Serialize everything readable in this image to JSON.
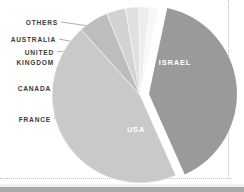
{
  "chart_data": {
    "type": "pie",
    "title": "",
    "subtitle": "",
    "xlabel": "",
    "ylabel": "",
    "legend_position": "callout-left",
    "grid": false,
    "exploded_slice": "ISRAEL",
    "categories": [
      "ISRAEL",
      "USA",
      "FRANCE",
      "CANADA",
      "UNITED KINGDOM",
      "AUSTRALIA",
      "OTHERS"
    ],
    "values": [
      40.0,
      45.0,
      5.5,
      3.5,
      2.5,
      2.0,
      1.5
    ],
    "slices": [
      {
        "label": "ISRAEL",
        "value": 40.0,
        "color": "#9a9a9a",
        "label_placement": "inside",
        "exploded": true
      },
      {
        "label": "USA",
        "value": 45.0,
        "color": "#c9c9c9",
        "label_placement": "inside",
        "exploded": false
      },
      {
        "label": "FRANCE",
        "value": 5.5,
        "color": "#bdbdbd",
        "label_placement": "callout",
        "exploded": false
      },
      {
        "label": "CANADA",
        "value": 3.5,
        "color": "#d2d2d2",
        "label_placement": "callout",
        "exploded": false
      },
      {
        "label": "UNITED KINGDOM",
        "value": 2.5,
        "color": "#e0e0e0",
        "label_placement": "callout",
        "exploded": false
      },
      {
        "label": "AUSTRALIA",
        "value": 2.0,
        "color": "#ededed",
        "label_placement": "callout",
        "exploded": false
      },
      {
        "label": "OTHERS",
        "value": 1.5,
        "color": "#f7f7f7",
        "label_placement": "callout",
        "exploded": false
      }
    ]
  },
  "callouts": [
    {
      "label": "OTHERS",
      "line": 1
    },
    {
      "label": "AUSTRALIA",
      "line": 1
    },
    {
      "label_line1": "UNITED",
      "label_line2": "KINGDOM",
      "line": 2
    },
    {
      "label": "CANADA",
      "line": 1
    },
    {
      "label": "FRANCE",
      "line": 1
    }
  ],
  "inside_labels": {
    "israel": "ISRAEL",
    "usa": "USA"
  },
  "colors": {
    "background": "#ffffff",
    "text": "#3a3a3a",
    "inside_text": "#ffffff",
    "leader_line": "#8d8d8d",
    "rule": "#c4c4c4",
    "bottom_bar": "#a9a9a9"
  }
}
